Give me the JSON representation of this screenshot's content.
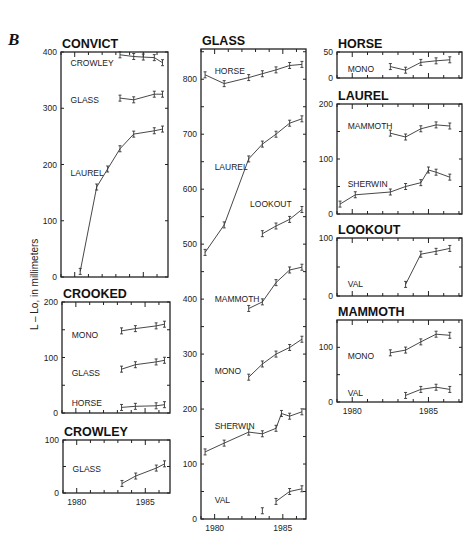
{
  "figure": {
    "letter": "B",
    "ylabel": "L – Lo, in millimeters"
  },
  "chart_data": {
    "type": "line",
    "title": "B",
    "ylabel": "L – Lo, in millimeters",
    "xlabel": "",
    "x_ticks": [
      "1980",
      "1985"
    ],
    "panels": [
      {
        "title": "CONVICT",
        "frame": {
          "x": 61,
          "y": 52,
          "w": 107,
          "h": 225
        },
        "xlim": [
          1979,
          1986.8
        ],
        "ylim": [
          0,
          400
        ],
        "yticks": [
          0,
          100,
          200,
          300,
          400
        ],
        "yticks_labeled": [
          0,
          100,
          200,
          300,
          400
        ],
        "show_xlabels": false,
        "series": [
          {
            "name": "CROWLEY",
            "label_pos": [
              1979.7,
              380
            ],
            "x": [
              1983.3,
              1984.3,
              1985.0,
              1985.8,
              1986.4
            ],
            "y": [
              395,
              392,
              391,
              390,
              381
            ]
          },
          {
            "name": "GLASS",
            "label_pos": [
              1979.7,
              315
            ],
            "x": [
              1983.3,
              1984.3,
              1985.8,
              1986.4
            ],
            "y": [
              318,
              315,
              325,
              325
            ]
          },
          {
            "name": "LAUREL",
            "label_pos": [
              1979.7,
              185
            ],
            "x": [
              1980.4,
              1981.6,
              1982.4,
              1983.3,
              1984.3,
              1985.8,
              1986.4
            ],
            "y": [
              10,
              160,
              192,
              228,
              254,
              260,
              263
            ]
          }
        ]
      },
      {
        "title": "CROOKED",
        "frame": {
          "x": 62,
          "y": 302,
          "w": 108,
          "h": 111
        },
        "xlim": [
          1979,
          1986.8
        ],
        "ylim": [
          0,
          200
        ],
        "yticks": [
          0,
          50,
          100,
          150,
          200
        ],
        "yticks_labeled": [
          0,
          100,
          200
        ],
        "show_xlabels": false,
        "series": [
          {
            "name": "MONO",
            "label_pos": [
              1979.7,
              140
            ],
            "x": [
              1983.3,
              1984.3,
              1985.8,
              1986.4
            ],
            "y": [
              148,
              152,
              157,
              160
            ]
          },
          {
            "name": "GLASS",
            "label_pos": [
              1979.7,
              72
            ],
            "x": [
              1983.3,
              1984.3,
              1985.8,
              1986.4
            ],
            "y": [
              79,
              87,
              92,
              95
            ]
          },
          {
            "name": "HORSE",
            "label_pos": [
              1979.7,
              18
            ],
            "x": [
              1983.3,
              1984.3,
              1985.8,
              1986.4
            ],
            "y": [
              10,
              12,
              13,
              15
            ]
          }
        ]
      },
      {
        "title": "CROWLEY",
        "frame": {
          "x": 63,
          "y": 440,
          "w": 107,
          "h": 53
        },
        "xlim": [
          1979,
          1986.8
        ],
        "ylim": [
          0,
          100
        ],
        "yticks": [
          0,
          50,
          100
        ],
        "yticks_labeled": [
          0,
          100
        ],
        "show_xlabels": true,
        "series": [
          {
            "name": "GLASS",
            "label_pos": [
              1979.7,
              45
            ],
            "x": [
              1983.3,
              1984.3,
              1985.8,
              1986.4
            ],
            "y": [
              18,
              32,
              47,
              55
            ]
          }
        ]
      },
      {
        "title": "GLASS",
        "frame": {
          "x": 201,
          "y": 49,
          "w": 105,
          "h": 470
        },
        "xlim": [
          1979,
          1986.7
        ],
        "ylim": [
          0,
          855
        ],
        "yticks": [
          0,
          50,
          100,
          150,
          200,
          250,
          300,
          350,
          400,
          450,
          500,
          550,
          600,
          650,
          700,
          750,
          800,
          850
        ],
        "yticks_labeled": [
          0,
          100,
          200,
          300,
          400,
          500,
          600,
          700,
          800
        ],
        "show_xlabels": true,
        "series": [
          {
            "name": "HORSE",
            "label_pos": [
              1980.0,
              815
            ],
            "x": [
              1979.3,
              1980.7,
              1982.5,
              1983.5,
              1984.5,
              1985.5,
              1986.4
            ],
            "y": [
              808,
              792,
              803,
              810,
              817,
              825,
              827
            ]
          },
          {
            "name": "LAUREL",
            "label_pos": [
              1980.0,
              640
            ],
            "x": [
              1979.3,
              1980.7,
              1982.5,
              1983.5,
              1984.5,
              1985.5,
              1986.4
            ],
            "y": [
              485,
              535,
              655,
              682,
              700,
              720,
              728
            ]
          },
          {
            "name": "LOOKOUT",
            "label_pos": [
              1982.6,
              573
            ],
            "x": [
              1983.5,
              1984.5,
              1985.5,
              1986.4
            ],
            "y": [
              519,
              533,
              545,
              563
            ]
          },
          {
            "name": "MAMMOTH",
            "label_pos": [
              1980.0,
              400
            ],
            "x": [
              1982.5,
              1983.5,
              1984.5,
              1985.5,
              1986.4
            ],
            "y": [
              383,
              395,
              430,
              453,
              458
            ]
          },
          {
            "name": "MONO",
            "label_pos": [
              1980.0,
              270
            ],
            "x": [
              1982.5,
              1983.5,
              1984.5,
              1985.5,
              1986.4
            ],
            "y": [
              258,
              282,
              300,
              312,
              327
            ]
          },
          {
            "name": "SHERWIN",
            "label_pos": [
              1980.0,
              170
            ],
            "x": [
              1979.3,
              1980.7,
              1982.5,
              1983.5,
              1984.5,
              1984.9,
              1985.5,
              1986.4
            ],
            "y": [
              122,
              138,
              158,
              155,
              165,
              192,
              187,
              195
            ]
          },
          {
            "name": "VAL",
            "label_pos": [
              1980.0,
              35
            ],
            "x": [
              1984.5,
              1985.5,
              1986.4
            ],
            "y": [
              32,
              50,
              55
            ]
          },
          {
            "name": "VAL (isolated point)",
            "label_pos": null,
            "x": [
              1983.5
            ],
            "y": [
              15
            ],
            "isolated": true
          }
        ]
      },
      {
        "title": "HORSE",
        "frame": {
          "x": 337,
          "y": 52,
          "w": 125,
          "h": 26
        },
        "xlim": [
          1979,
          1987.2
        ],
        "ylim": [
          0,
          50
        ],
        "yticks": [
          0,
          50
        ],
        "yticks_labeled": [
          0,
          50
        ],
        "show_xlabels": false,
        "series": [
          {
            "name": "MONO",
            "label_pos": [
              1979.7,
              18
            ],
            "x": [
              1982.5,
              1983.5,
              1984.5,
              1985.5,
              1986.4
            ],
            "y": [
              22,
              15,
              30,
              33,
              35
            ]
          }
        ]
      },
      {
        "title": "LAUREL",
        "frame": {
          "x": 337,
          "y": 104,
          "w": 125,
          "h": 110
        },
        "xlim": [
          1979,
          1987.2
        ],
        "ylim": [
          0,
          200
        ],
        "yticks": [
          0,
          50,
          100,
          150,
          200
        ],
        "yticks_labeled": [
          0,
          100,
          200
        ],
        "show_xlabels": false,
        "series": [
          {
            "name": "MAMMOTH",
            "label_pos": [
              1979.7,
              160
            ],
            "x": [
              1982.5,
              1983.5,
              1984.5,
              1985.5,
              1986.4
            ],
            "y": [
              147,
              140,
              155,
              162,
              160
            ]
          },
          {
            "name": "SHERWIN",
            "label_pos": [
              1979.7,
              55
            ],
            "x": [
              1979.2,
              1980.2,
              1982.5,
              1983.5,
              1984.5,
              1985.0,
              1985.5,
              1986.4
            ],
            "y": [
              18,
              35,
              40,
              50,
              57,
              80,
              76,
              67
            ]
          }
        ]
      },
      {
        "title": "LOOKOUT",
        "frame": {
          "x": 337,
          "y": 238,
          "w": 125,
          "h": 58
        },
        "xlim": [
          1979,
          1987.2
        ],
        "ylim": [
          0,
          100
        ],
        "yticks": [
          0,
          50,
          100
        ],
        "yticks_labeled": [
          0,
          100
        ],
        "show_xlabels": false,
        "series": [
          {
            "name": "VAL",
            "label_pos": [
              1979.7,
              20
            ],
            "x": [
              1983.5,
              1984.5,
              1985.5,
              1986.4
            ],
            "y": [
              20,
              72,
              77,
              82
            ]
          }
        ]
      },
      {
        "title": "MAMMOTH",
        "frame": {
          "x": 337,
          "y": 320,
          "w": 125,
          "h": 82
        },
        "xlim": [
          1979,
          1987.2
        ],
        "ylim": [
          0,
          150
        ],
        "yticks": [
          0,
          50,
          100
        ],
        "yticks_labeled": [
          0,
          100
        ],
        "show_xlabels": true,
        "series": [
          {
            "name": "MONO",
            "label_pos": [
              1979.7,
              85
            ],
            "x": [
              1982.5,
              1983.5,
              1984.5,
              1985.5,
              1986.4
            ],
            "y": [
              90,
              95,
              110,
              124,
              122
            ]
          },
          {
            "name": "VAL",
            "label_pos": [
              1979.7,
              17
            ],
            "x": [
              1983.5,
              1984.5,
              1985.5,
              1986.4
            ],
            "y": [
              12,
              23,
              27,
              23
            ]
          }
        ]
      }
    ]
  }
}
